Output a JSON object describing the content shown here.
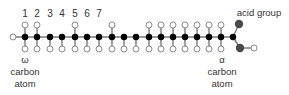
{
  "colors": {
    "bond": "#7a7a7a",
    "carbon": "#000000",
    "hydrogen_stroke": "#8a8a8a",
    "hydrogen_fill": "#ffffff",
    "oxygen": "#4a4a4a",
    "text": "#333333"
  },
  "labels": {
    "numbers": [
      "1",
      "2",
      "3",
      "4",
      "5",
      "6",
      "7"
    ],
    "omega": {
      "symbol": "ω",
      "line1": "carbon",
      "line2": "atom"
    },
    "alpha": {
      "symbol": "α",
      "line1": "carbon",
      "line2": "atom"
    },
    "acid_group": "acid group"
  },
  "chain": {
    "carbon_count": 18,
    "carbon_x": [
      25,
      37,
      50,
      62,
      75,
      87,
      99,
      112,
      124,
      136,
      149,
      161,
      173,
      185,
      197,
      209,
      221,
      233
    ],
    "top_hydrogen_x": [
      25,
      37,
      75,
      112,
      149,
      161,
      173,
      185,
      197,
      209,
      221
    ],
    "bottom_hydrogen_x": [
      25,
      37,
      50,
      62,
      75,
      87,
      99,
      112,
      124,
      136,
      149,
      161,
      173,
      185,
      197,
      209,
      221
    ],
    "terminal_hydrogen_x": 13
  }
}
